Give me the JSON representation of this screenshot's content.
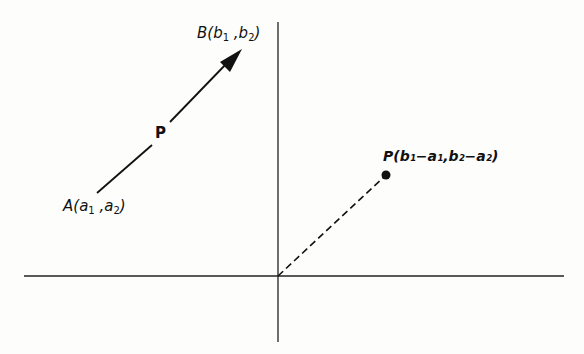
{
  "diagram": {
    "type": "vector-translation",
    "point_a": {
      "label": "A",
      "coords_text": [
        "a",
        "1",
        "a",
        "2"
      ]
    },
    "point_b": {
      "label": "B",
      "coords_text": [
        "b",
        "1",
        "b",
        "2"
      ]
    },
    "vector_label": "P",
    "translated_point": {
      "label": "P",
      "text": "(b₁−a₁,b₂−a₂)"
    },
    "colors": {
      "ink": "#111111",
      "background": "#fdfdfc"
    }
  }
}
